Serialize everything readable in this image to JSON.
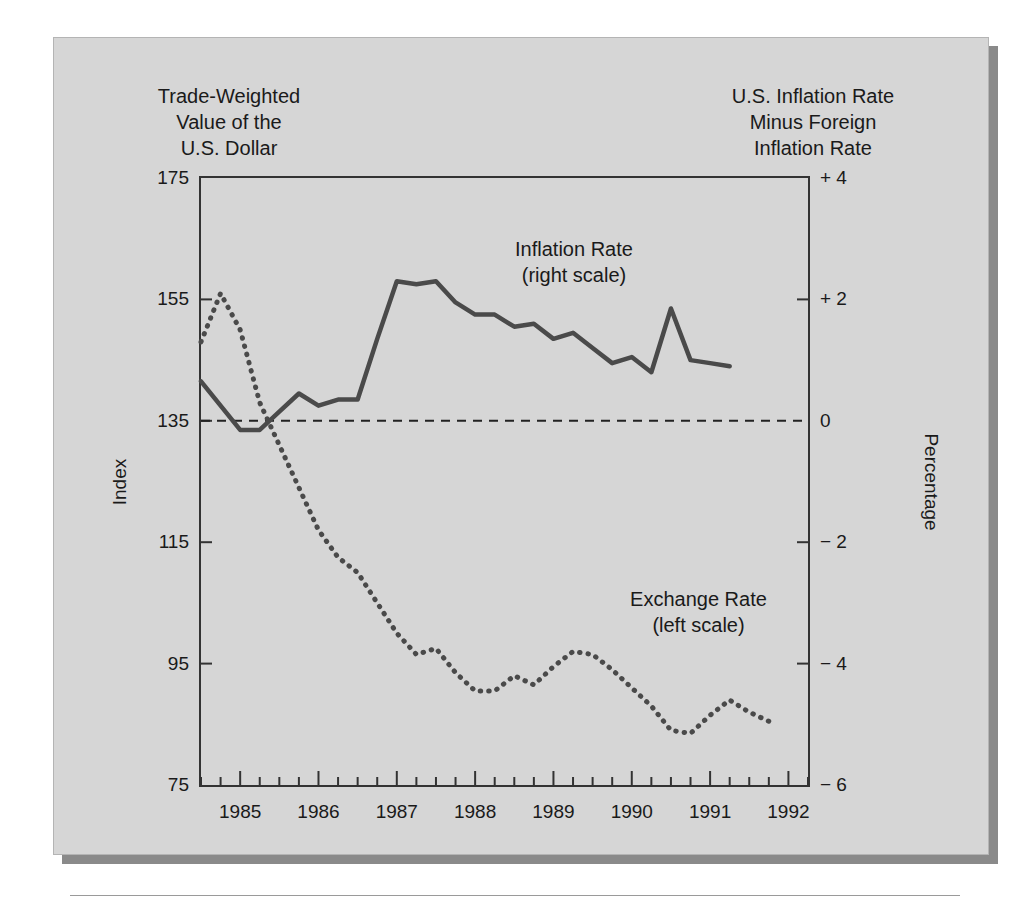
{
  "captions": {
    "left": "Trade-Weighted\nValue of the\nU.S. Dollar",
    "right": "U.S. Inflation Rate\nMinus Foreign\nInflation Rate"
  },
  "notes": {
    "inflation": "Inflation Rate\n(right scale)",
    "exchange": "Exchange Rate\n(left scale)"
  },
  "axes": {
    "left_title": "Index",
    "right_title": "Percentage",
    "left_ticks": [
      "175",
      "155",
      "135",
      "115",
      "95",
      "75"
    ],
    "right_ticks": [
      "+ 4",
      "+ 2",
      "0",
      "− 2",
      "− 4",
      "− 6"
    ],
    "x_ticks": [
      "1985",
      "1986",
      "1987",
      "1988",
      "1989",
      "1990",
      "1991",
      "1992"
    ]
  },
  "colors": {
    "panel": "#d6d6d6",
    "shadow": "#8a8a8a",
    "frame": "#333333",
    "series": "#4a4a4a",
    "text": "#1a1a1a"
  },
  "chart_data": {
    "type": "line",
    "title": "",
    "xlabel": "",
    "ylabel": "Index",
    "y2label": "Percentage",
    "xlim": [
      1984.5,
      1992.25
    ],
    "ylim": [
      75,
      175
    ],
    "y2lim": [
      -6,
      4
    ],
    "xticks": [
      1985,
      1986,
      1987,
      1988,
      1989,
      1990,
      1991,
      1992
    ],
    "yticks": [
      75,
      95,
      115,
      135,
      155,
      175
    ],
    "y2ticks": [
      -6,
      -4,
      -2,
      0,
      2,
      4
    ],
    "grid": false,
    "legend": "inline-annotations",
    "zero_reference_line": 0,
    "series": [
      {
        "name": "Exchange Rate (left scale)",
        "axis": "left",
        "style": "dotted",
        "units": "Index",
        "x": [
          1984.5,
          1984.75,
          1985.0,
          1985.25,
          1985.5,
          1985.75,
          1986.0,
          1986.25,
          1986.5,
          1986.75,
          1987.0,
          1987.25,
          1987.5,
          1987.75,
          1988.0,
          1988.25,
          1988.5,
          1988.75,
          1989.0,
          1989.25,
          1989.5,
          1989.75,
          1990.0,
          1990.25,
          1990.5,
          1990.75,
          1991.0,
          1991.25,
          1991.5,
          1991.75
        ],
        "y": [
          148.0,
          156.0,
          150.0,
          138.0,
          131.0,
          124.0,
          117.0,
          112.5,
          110.0,
          105.0,
          100.0,
          96.5,
          97.5,
          93.5,
          90.5,
          90.5,
          93.0,
          91.5,
          94.5,
          97.0,
          96.5,
          94.0,
          91.0,
          88.0,
          84.0,
          83.5,
          86.5,
          89.0,
          87.0,
          85.5
        ]
      },
      {
        "name": "Inflation Rate (right scale)",
        "axis": "right",
        "style": "solid",
        "units": "Percentage points",
        "x": [
          1984.5,
          1984.75,
          1985.0,
          1985.25,
          1985.5,
          1985.75,
          1986.0,
          1986.25,
          1986.5,
          1986.75,
          1987.0,
          1987.25,
          1987.5,
          1987.75,
          1988.0,
          1988.25,
          1988.5,
          1988.75,
          1989.0,
          1989.25,
          1989.5,
          1989.75,
          1990.0,
          1990.25,
          1990.5,
          1990.75,
          1991.0,
          1991.25
        ],
        "y": [
          0.65,
          0.25,
          -0.15,
          -0.15,
          0.15,
          0.45,
          0.25,
          0.35,
          0.35,
          1.35,
          2.3,
          2.25,
          2.3,
          1.95,
          1.75,
          1.75,
          1.55,
          1.6,
          1.35,
          1.45,
          1.2,
          0.95,
          1.05,
          0.8,
          1.85,
          1.0,
          0.95,
          0.9
        ]
      }
    ]
  }
}
